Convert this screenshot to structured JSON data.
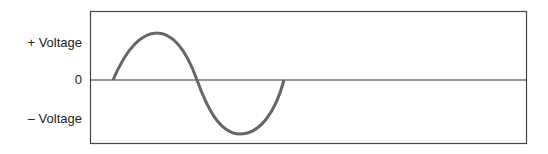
{
  "diagram": {
    "labels": {
      "positive": "+ Voltage",
      "zero": "0",
      "negative": "– Voltage"
    },
    "colors": {
      "frame": "#333333",
      "wave": "#666666"
    },
    "wave": {
      "type": "sine",
      "cycles": 1,
      "start": [
        113,
        80
      ],
      "peak": [
        158,
        33
      ],
      "zero_cross": [
        197,
        80
      ],
      "trough": [
        240,
        134
      ],
      "end": [
        284,
        80
      ]
    }
  }
}
